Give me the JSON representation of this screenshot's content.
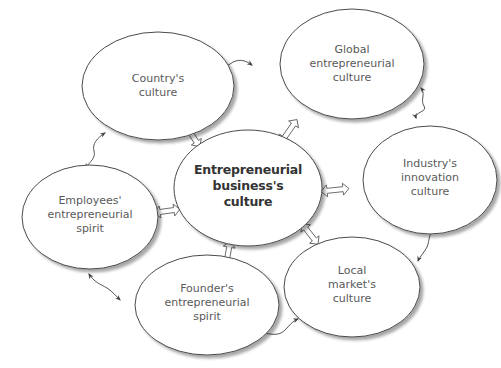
{
  "diagram": {
    "center": {
      "id": "entrepreneurial-business-culture",
      "lines": [
        "Entrepreneurial",
        "business's",
        "culture"
      ],
      "x": 248,
      "y": 188,
      "rx": 74,
      "ry": 58
    },
    "nodes": [
      {
        "id": "country-culture",
        "lines": [
          "Country's",
          "culture"
        ],
        "x": 158,
        "y": 86,
        "rx": 76,
        "ry": 54
      },
      {
        "id": "global-entrepreneurial-culture",
        "lines": [
          "Global",
          "entrepreneurial",
          "culture"
        ],
        "x": 352,
        "y": 64,
        "rx": 72,
        "ry": 55
      },
      {
        "id": "industry-innovation-culture",
        "lines": [
          "Industry's",
          "innovation",
          "culture"
        ],
        "x": 430,
        "y": 180,
        "rx": 67,
        "ry": 54
      },
      {
        "id": "local-market-culture",
        "lines": [
          "Local",
          "market's",
          "culture"
        ],
        "x": 352,
        "y": 287,
        "rx": 68,
        "ry": 50
      },
      {
        "id": "founder-entrepreneurial-spirit",
        "lines": [
          "Founder's",
          "entrepreneurial",
          "spirit"
        ],
        "x": 207,
        "y": 305,
        "rx": 72,
        "ry": 50
      },
      {
        "id": "employees-entrepreneurial-spirit",
        "lines": [
          "Employees'",
          "entrepreneurial",
          "spirit"
        ],
        "x": 90,
        "y": 217,
        "rx": 68,
        "ry": 52
      }
    ],
    "links": {
      "hollow_double_arrows": [
        {
          "from": "country-culture",
          "to": "entrepreneurial-business-culture"
        },
        {
          "from": "global-entrepreneurial-culture",
          "to": "entrepreneurial-business-culture"
        },
        {
          "from": "industry-innovation-culture",
          "to": "entrepreneurial-business-culture"
        },
        {
          "from": "local-market-culture",
          "to": "entrepreneurial-business-culture"
        },
        {
          "from": "founder-entrepreneurial-spirit",
          "to": "entrepreneurial-business-culture"
        },
        {
          "from": "employees-entrepreneurial-spirit",
          "to": "entrepreneurial-business-culture"
        }
      ],
      "wavy_double_arrows": [
        {
          "from": "country-culture",
          "to": "global-entrepreneurial-culture"
        },
        {
          "from": "global-entrepreneurial-culture",
          "to": "industry-innovation-culture"
        },
        {
          "from": "industry-innovation-culture",
          "to": "local-market-culture"
        },
        {
          "from": "local-market-culture",
          "to": "founder-entrepreneurial-spirit"
        },
        {
          "from": "founder-entrepreneurial-spirit",
          "to": "employees-entrepreneurial-spirit"
        },
        {
          "from": "employees-entrepreneurial-spirit",
          "to": "country-culture"
        }
      ]
    },
    "colors": {
      "ellipse_stroke": "#4a4a4a",
      "ellipse_shadow": "#bdbdbd",
      "text": "#5a5a5a",
      "center_text": "#333333",
      "arrow": "#555555",
      "background": "#ffffff"
    }
  }
}
